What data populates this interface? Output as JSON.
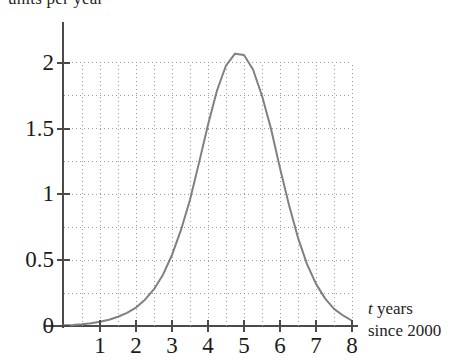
{
  "chart_data": {
    "type": "line",
    "title": "",
    "subtitle": "",
    "ylabel_top": "units per year",
    "xlabel_lines": [
      "t years",
      "since 2000"
    ],
    "xlabel_italic_prefix": "t",
    "xlabel_rest": " years",
    "xlabel_second_line": "since 2000",
    "xlim": [
      0,
      8
    ],
    "ylim": [
      0,
      2.25
    ],
    "x_ticks": [
      1,
      2,
      3,
      4,
      5,
      6,
      7,
      8
    ],
    "x_tick_labels": [
      "1",
      "2",
      "3",
      "4",
      "5",
      "6",
      "7",
      "8"
    ],
    "y_ticks": [
      0,
      0.5,
      1,
      1.5,
      2
    ],
    "y_tick_labels": [
      "0",
      "0.5",
      "1",
      "1.5",
      "2"
    ],
    "grid": {
      "visible": true,
      "style": "dotted",
      "color": "#9a9a9a",
      "x_minor_step": 0.5,
      "y_minor_step": 0.25,
      "x_gridlines": [
        0.5,
        1,
        1.5,
        2,
        2.5,
        3,
        3.5,
        4,
        4.5,
        5,
        5.5,
        6,
        6.5,
        7,
        7.5,
        8
      ],
      "y_gridlines": [
        0.25,
        0.5,
        0.75,
        1,
        1.25,
        1.5,
        1.75,
        2
      ]
    },
    "legend": {
      "visible": false,
      "position": "none"
    },
    "series": [
      {
        "name": "rate",
        "color": "#808080",
        "line_width": 2,
        "peak": {
          "x": 5.08,
          "y": 2.08
        },
        "x": [
          0,
          0.25,
          0.5,
          0.75,
          1,
          1.25,
          1.5,
          1.75,
          2,
          2.25,
          2.5,
          2.75,
          3,
          3.25,
          3.5,
          3.75,
          4,
          4.25,
          4.5,
          4.75,
          5,
          5.25,
          5.5,
          5.75,
          6,
          6.25,
          6.5,
          6.75,
          7,
          7.25,
          7.5,
          7.75,
          8
        ],
        "values": [
          0.005,
          0.008,
          0.013,
          0.021,
          0.032,
          0.048,
          0.07,
          0.1,
          0.14,
          0.2,
          0.28,
          0.39,
          0.54,
          0.73,
          0.96,
          1.24,
          1.53,
          1.79,
          1.98,
          2.07,
          2.06,
          1.95,
          1.75,
          1.5,
          1.2,
          0.92,
          0.67,
          0.47,
          0.32,
          0.21,
          0.13,
          0.08,
          0.04
        ]
      }
    ]
  },
  "axes": {
    "axis_color": "#4a4a4a",
    "tick_color": "#4a4a4a"
  }
}
